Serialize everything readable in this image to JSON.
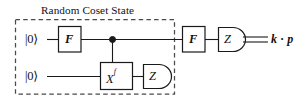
{
  "figure": {
    "type": "quantum-circuit-diagram",
    "background_color": "#ffffff",
    "line_color": "#1a1a1a",
    "dashed_box_color": "#4a4a4a"
  },
  "group": {
    "title": "Random Coset State",
    "style": "dashed-rectangle"
  },
  "qubits": [
    {
      "id": "q0",
      "input_label": "|0⟩",
      "row": "top"
    },
    {
      "id": "q1",
      "input_label": "|0⟩",
      "row": "bottom"
    }
  ],
  "gates": [
    {
      "id": "f-gate-1",
      "label": "F",
      "row": "top",
      "kind": "box",
      "inside_group": true
    },
    {
      "id": "control-dot",
      "label": "",
      "row": "top",
      "kind": "control",
      "inside_group": true
    },
    {
      "id": "xf-gate",
      "label": "X",
      "exponent": "f",
      "row": "bottom",
      "kind": "box",
      "inside_group": true
    },
    {
      "id": "z-measure-bottom",
      "label": "Z",
      "row": "bottom",
      "kind": "meter",
      "inside_group": true
    },
    {
      "id": "f-gate-2",
      "label": "F",
      "row": "top",
      "kind": "box",
      "inside_group": false
    },
    {
      "id": "z-measure-top",
      "label": "Z",
      "row": "top",
      "kind": "meter",
      "inside_group": false
    }
  ],
  "output": {
    "label": "k · p",
    "wire_style": "double-classical"
  }
}
